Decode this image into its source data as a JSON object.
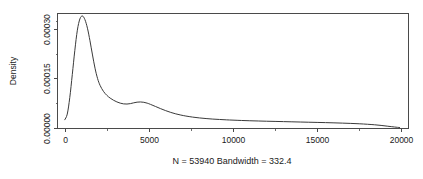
{
  "chart_data": {
    "type": "line",
    "title": "",
    "subtitle": "",
    "xlabel": "N = 53940   Bandwidth = 332.4",
    "ylabel": "Density",
    "xlim": [
      -400,
      20400
    ],
    "ylim": [
      0.0,
      0.000345
    ],
    "grid": false,
    "legend": false,
    "legend_position": "none",
    "x_ticks": [
      0,
      5000,
      10000,
      15000,
      20000
    ],
    "x_tick_labels": [
      "0",
      "5000",
      "10000",
      "15000",
      "20000"
    ],
    "x_minor_ticks": [
      2500,
      7500,
      12500,
      17500
    ],
    "y_ticks": [
      0.0,
      0.00015,
      0.0003
    ],
    "y_tick_labels": [
      "0.00000",
      "0.00015",
      "0.00030"
    ],
    "y_minor_ticks": [
      7.5e-05,
      0.000225,
      0.000325
    ],
    "series": [
      {
        "name": "density",
        "x": [
          0,
          150,
          300,
          450,
          600,
          750,
          900,
          1050,
          1200,
          1350,
          1500,
          1650,
          1800,
          1950,
          2100,
          2300,
          2500,
          2700,
          2900,
          3100,
          3300,
          3500,
          3700,
          3900,
          4100,
          4300,
          4500,
          4700,
          4900,
          5100,
          5400,
          5700,
          6000,
          6300,
          6600,
          6900,
          7200,
          7600,
          8000,
          8400,
          8800,
          9200,
          9600,
          10000,
          10500,
          11000,
          11500,
          12000,
          12500,
          13000,
          13500,
          14000,
          14500,
          15000,
          15500,
          16000,
          16500,
          17000,
          17500,
          18000,
          18400,
          18800,
          19200,
          19600,
          19900
        ],
        "y": [
          2.5e-05,
          4.2e-05,
          9.2e-05,
          0.000162,
          0.000235,
          0.000296,
          0.00033,
          0.000339,
          0.000328,
          0.000302,
          0.000264,
          0.000221,
          0.000181,
          0.00015,
          0.000129,
          0.000111,
          9.9e-05,
          9.05e-05,
          8.4e-05,
          7.9e-05,
          7.52e-05,
          7.3e-05,
          7.25e-05,
          7.38e-05,
          7.62e-05,
          7.82e-05,
          7.88e-05,
          7.78e-05,
          7.52e-05,
          7.14e-05,
          6.5e-05,
          5.85e-05,
          5.25e-05,
          4.72e-05,
          4.28e-05,
          3.92e-05,
          3.62e-05,
          3.3e-05,
          3.05e-05,
          2.86e-05,
          2.7e-05,
          2.58e-05,
          2.47e-05,
          2.38e-05,
          2.28e-05,
          2.19e-05,
          2.12e-05,
          2.05e-05,
          1.99e-05,
          1.93e-05,
          1.87e-05,
          1.81e-05,
          1.75e-05,
          1.69e-05,
          1.63e-05,
          1.56e-05,
          1.48e-05,
          1.39e-05,
          1.28e-05,
          1.13e-05,
          9.8e-06,
          7.8e-06,
          5.4e-06,
          3e-06,
          1.4e-06
        ]
      }
    ]
  },
  "axes": {
    "y_title": "Density",
    "x_caption": "N = 53940   Bandwidth = 332.4"
  }
}
